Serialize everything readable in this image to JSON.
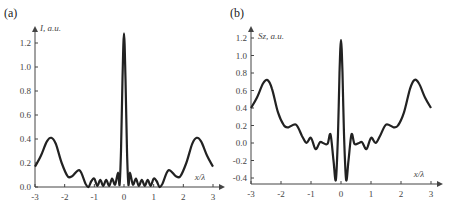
{
  "chart_data": [
    {
      "type": "line",
      "panel_label": "(a)",
      "ylabel": "I, a.u.",
      "xlabel": "x/λ",
      "xlim": [
        -3,
        3
      ],
      "ylim": [
        0,
        1.3
      ],
      "xticks": [
        "-3",
        "-2",
        "-1",
        "0",
        "1",
        "2",
        "3"
      ],
      "yticks": [
        "0.0",
        "0.2",
        "0.4",
        "0.6",
        "0.8",
        "1.0",
        "1.2"
      ],
      "grid": false,
      "x": [
        -3.0,
        -2.8,
        -2.6,
        -2.45,
        -2.3,
        -2.1,
        -1.9,
        -1.75,
        -1.5,
        -1.3,
        -1.2,
        -1.1,
        -1.0,
        -0.9,
        -0.8,
        -0.7,
        -0.6,
        -0.5,
        -0.4,
        -0.3,
        -0.2,
        -0.15,
        -0.1,
        -0.05,
        0.0,
        0.05,
        0.1,
        0.15,
        0.2,
        0.3,
        0.4,
        0.5,
        0.6,
        0.7,
        0.8,
        0.9,
        1.0,
        1.1,
        1.2,
        1.3,
        1.5,
        1.75,
        1.9,
        2.1,
        2.3,
        2.45,
        2.6,
        2.8,
        3.0
      ],
      "values": [
        0.17,
        0.26,
        0.38,
        0.41,
        0.36,
        0.2,
        0.09,
        0.09,
        0.14,
        0.03,
        0.0,
        0.05,
        0.07,
        0.01,
        0.06,
        0.01,
        0.06,
        0.01,
        0.07,
        0.02,
        0.12,
        0.02,
        0.3,
        0.9,
        1.28,
        0.9,
        0.3,
        0.02,
        0.12,
        0.02,
        0.07,
        0.01,
        0.06,
        0.01,
        0.06,
        0.01,
        0.07,
        0.05,
        0.0,
        0.03,
        0.14,
        0.09,
        0.09,
        0.2,
        0.36,
        0.41,
        0.38,
        0.26,
        0.17
      ]
    },
    {
      "type": "line",
      "panel_label": "(b)",
      "ylabel": "Sz, a.u.",
      "xlabel": "x/λ",
      "xlim": [
        -3,
        3
      ],
      "ylim": [
        -0.45,
        1.3
      ],
      "xticks": [
        "-3",
        "-2",
        "-1",
        "0",
        "1",
        "2",
        "3"
      ],
      "yticks": [
        "-0.4",
        "-0.2",
        "0.0",
        "0.2",
        "0.4",
        "0.6",
        "0.8",
        "1.0",
        "1.2"
      ],
      "grid": false,
      "x": [
        -3.0,
        -2.8,
        -2.6,
        -2.45,
        -2.3,
        -2.1,
        -1.9,
        -1.75,
        -1.5,
        -1.3,
        -1.15,
        -1.0,
        -0.85,
        -0.7,
        -0.6,
        -0.45,
        -0.35,
        -0.25,
        -0.17,
        -0.1,
        -0.05,
        0.0,
        0.05,
        0.1,
        0.17,
        0.25,
        0.35,
        0.45,
        0.6,
        0.7,
        0.85,
        1.0,
        1.15,
        1.3,
        1.5,
        1.75,
        1.9,
        2.1,
        2.3,
        2.45,
        2.6,
        2.8,
        3.0
      ],
      "values": [
        0.4,
        0.52,
        0.68,
        0.72,
        0.62,
        0.35,
        0.2,
        0.18,
        0.21,
        0.08,
        0.0,
        0.06,
        -0.07,
        0.01,
        0.0,
        -0.01,
        0.1,
        -0.2,
        -0.42,
        0.1,
        0.8,
        1.18,
        0.8,
        0.1,
        -0.42,
        -0.2,
        0.1,
        -0.01,
        0.0,
        0.01,
        -0.07,
        0.06,
        0.0,
        0.08,
        0.21,
        0.18,
        0.2,
        0.35,
        0.62,
        0.72,
        0.68,
        0.52,
        0.4
      ]
    }
  ]
}
